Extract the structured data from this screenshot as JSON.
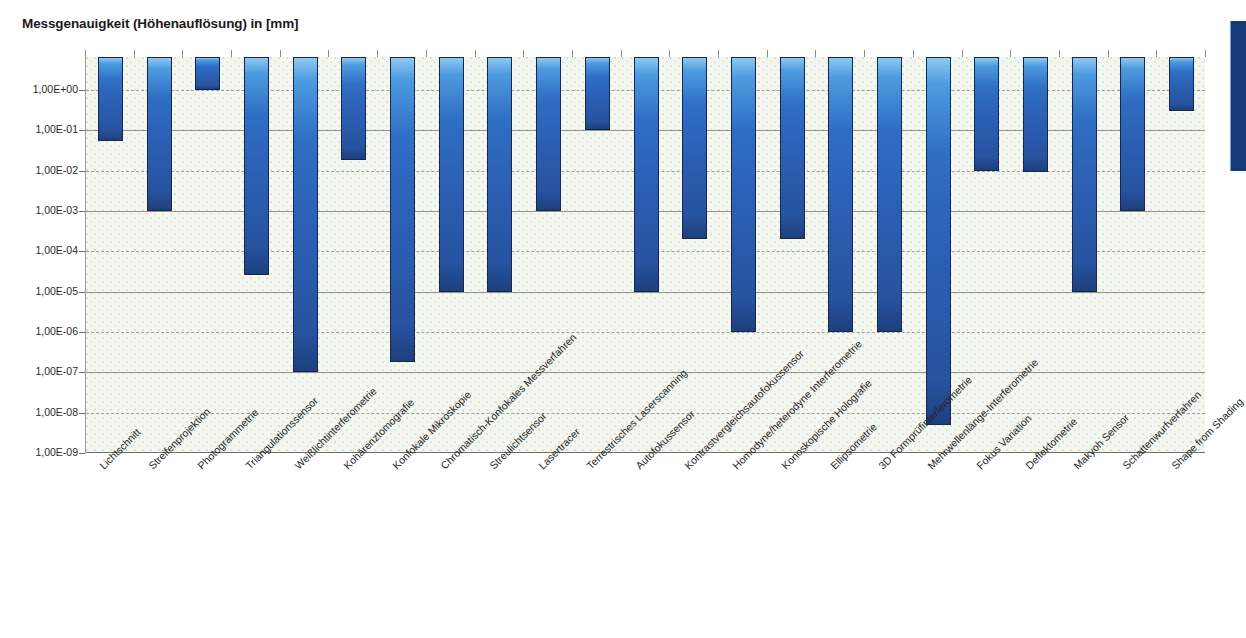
{
  "chart_data": {
    "type": "bar",
    "title": "Messgenauigkeit (Höhenauflösung) in [mm]",
    "xlabel": "",
    "ylabel": "",
    "yscale": "log",
    "ylim": [
      1e-09,
      6.5
    ],
    "grid": true,
    "legend": false,
    "orientation": "vertical-downward",
    "note": "Bars hang from the top of the plot area down to the value (measurement accuracy / height resolution in mm). Lower bar end = finer resolution.",
    "ytick_labels": [
      "1,00E+00",
      "1,00E-01",
      "1,00E-02",
      "1,00E-03",
      "1,00E-04",
      "1,00E-05",
      "1,00E-06",
      "1,00E-07",
      "1,00E-08",
      "1,00E-09"
    ],
    "ytick_values": [
      1,
      0.1,
      0.01,
      0.001,
      0.0001,
      1e-05,
      1e-06,
      1e-07,
      1e-08,
      1e-09
    ],
    "categories": [
      "Lichtschnitt",
      "Streifenprojektion",
      "Photogrammetrie",
      "Triangulationssensor",
      "Weißlichtinterferometrie",
      "Kohärenztomografie",
      "Konfokale Mikroskopie",
      "Chromatisch-Konfokales Messverfahren",
      "Streulichtsensor",
      "Lasertracer",
      "Terrestrisches Laserscanning",
      "Autofokussensor",
      "Kontrastvergleichsautofokussensor",
      "Homodyne/heterodyne Interferometrie",
      "Konoskopische Holografie",
      "Ellipsometrie",
      "3D Formprüfinterferometrie",
      "Mehrwellenlänge-Interferometrie",
      "Fokus Variation",
      "Deflektometrie",
      "Makyoh Sensor",
      "Schattenwurfverfahren",
      "Shape from Shading"
    ],
    "values": [
      0.055,
      0.001,
      1.0,
      2.6e-05,
      1e-07,
      0.018,
      1.8e-07,
      1e-05,
      1e-05,
      0.001,
      0.1,
      1e-05,
      0.0002,
      1e-06,
      0.0002,
      1e-06,
      1e-06,
      5e-09,
      0.0095,
      0.009,
      1e-05,
      0.001,
      0.3
    ],
    "bar_tops": [
      6.5,
      6.5,
      6.5,
      6.5,
      6.5,
      6.5,
      6.5,
      6.5,
      6.5,
      6.5,
      6.5,
      6.5,
      6.5,
      6.5,
      6.5,
      6.5,
      6.5,
      6.5,
      6.5,
      6.5,
      6.5,
      6.5,
      6.5
    ],
    "bar_color": "#2b5fb4",
    "bar_border_color": "#16264f",
    "plot_background": "#f4f7ef",
    "gridline_color": "#9b9b93"
  },
  "accent_block": {
    "name": "edge-marker",
    "color": "#153a77"
  }
}
